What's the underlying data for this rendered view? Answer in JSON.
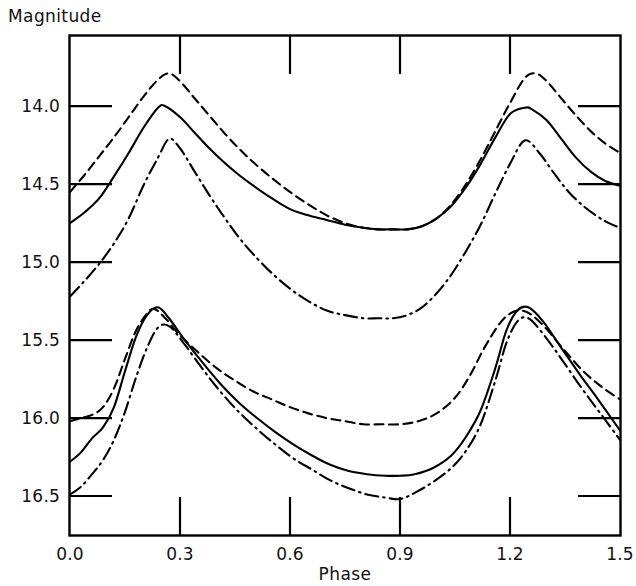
{
  "chart_data": {
    "type": "line",
    "title": "",
    "xlabel": "Phase",
    "ylabel": "Magnitude",
    "xlim": [
      0.0,
      1.5
    ],
    "ylim": [
      16.75,
      13.55
    ],
    "y_inverted": true,
    "grid": false,
    "legend_position": "none",
    "xticks": [
      0.0,
      0.3,
      0.6,
      0.9,
      1.2,
      1.5
    ],
    "xtick_labels": [
      "0.0",
      "0.3",
      "0.6",
      "0.9",
      "1.2",
      "1.5"
    ],
    "yticks": [
      14.0,
      14.5,
      15.0,
      15.5,
      16.0,
      16.5
    ],
    "ytick_labels": [
      "14.0",
      "14.5",
      "15.0",
      "15.5",
      "16.0",
      "16.5"
    ],
    "series": [
      {
        "name": "upper-band-dashed",
        "group": "upper",
        "style": "dashed",
        "x": [
          0.0,
          0.04,
          0.08,
          0.12,
          0.16,
          0.2,
          0.24,
          0.27,
          0.3,
          0.34,
          0.38,
          0.42,
          0.46,
          0.5,
          0.55,
          0.6,
          0.65,
          0.7,
          0.75,
          0.8,
          0.84,
          0.88,
          0.92,
          0.96,
          1.0,
          1.04,
          1.08,
          1.12,
          1.16,
          1.2,
          1.24,
          1.27,
          1.3,
          1.34,
          1.38,
          1.42,
          1.46,
          1.5
        ],
        "y": [
          14.55,
          14.44,
          14.32,
          14.2,
          14.07,
          13.94,
          13.83,
          13.79,
          13.84,
          13.95,
          14.06,
          14.17,
          14.27,
          14.36,
          14.46,
          14.55,
          14.63,
          14.7,
          14.75,
          14.78,
          14.79,
          14.79,
          14.79,
          14.77,
          14.72,
          14.63,
          14.5,
          14.34,
          14.16,
          13.98,
          13.82,
          13.79,
          13.84,
          13.95,
          14.06,
          14.16,
          14.24,
          14.3
        ]
      },
      {
        "name": "upper-band-solid",
        "group": "upper",
        "style": "solid",
        "x": [
          0.0,
          0.04,
          0.08,
          0.12,
          0.16,
          0.2,
          0.24,
          0.26,
          0.3,
          0.34,
          0.38,
          0.42,
          0.46,
          0.5,
          0.55,
          0.6,
          0.65,
          0.7,
          0.75,
          0.8,
          0.84,
          0.88,
          0.92,
          0.96,
          1.0,
          1.04,
          1.08,
          1.12,
          1.16,
          1.2,
          1.24,
          1.26,
          1.3,
          1.34,
          1.38,
          1.42,
          1.46,
          1.5
        ],
        "y": [
          14.75,
          14.68,
          14.59,
          14.45,
          14.3,
          14.14,
          14.01,
          14.0,
          14.07,
          14.17,
          14.27,
          14.36,
          14.44,
          14.51,
          14.59,
          14.66,
          14.7,
          14.73,
          14.76,
          14.78,
          14.79,
          14.79,
          14.79,
          14.77,
          14.72,
          14.64,
          14.52,
          14.37,
          14.2,
          14.05,
          14.01,
          14.02,
          14.09,
          14.21,
          14.33,
          14.42,
          14.48,
          14.51
        ]
      },
      {
        "name": "upper-band-dashdot",
        "group": "upper",
        "style": "dashdot",
        "x": [
          0.0,
          0.04,
          0.08,
          0.12,
          0.16,
          0.2,
          0.24,
          0.27,
          0.3,
          0.34,
          0.38,
          0.42,
          0.46,
          0.5,
          0.55,
          0.6,
          0.65,
          0.7,
          0.75,
          0.8,
          0.84,
          0.88,
          0.92,
          0.96,
          1.0,
          1.04,
          1.08,
          1.12,
          1.16,
          1.2,
          1.24,
          1.28,
          1.32,
          1.36,
          1.4,
          1.44,
          1.47,
          1.5
        ],
        "y": [
          15.22,
          15.12,
          15.01,
          14.88,
          14.72,
          14.51,
          14.33,
          14.21,
          14.27,
          14.42,
          14.57,
          14.71,
          14.84,
          14.95,
          15.07,
          15.17,
          15.25,
          15.31,
          15.34,
          15.36,
          15.36,
          15.36,
          15.34,
          15.29,
          15.2,
          15.08,
          14.93,
          14.76,
          14.56,
          14.37,
          14.22,
          14.3,
          14.43,
          14.55,
          14.64,
          14.71,
          14.75,
          14.78
        ]
      },
      {
        "name": "lower-band-dashed",
        "group": "lower",
        "style": "dashed",
        "x": [
          0.0,
          0.03,
          0.06,
          0.09,
          0.12,
          0.15,
          0.18,
          0.21,
          0.23,
          0.26,
          0.3,
          0.35,
          0.4,
          0.45,
          0.5,
          0.55,
          0.6,
          0.65,
          0.7,
          0.75,
          0.8,
          0.85,
          0.9,
          0.95,
          1.0,
          1.05,
          1.09,
          1.13,
          1.17,
          1.2,
          1.23,
          1.26,
          1.3,
          1.35,
          1.4,
          1.45,
          1.5
        ],
        "y": [
          16.02,
          16.0,
          15.98,
          15.93,
          15.81,
          15.62,
          15.44,
          15.33,
          15.3,
          15.36,
          15.47,
          15.58,
          15.68,
          15.76,
          15.83,
          15.88,
          15.93,
          15.97,
          16.0,
          16.02,
          16.04,
          16.04,
          16.04,
          16.02,
          15.97,
          15.87,
          15.73,
          15.55,
          15.4,
          15.33,
          15.31,
          15.34,
          15.43,
          15.57,
          15.7,
          15.8,
          15.88
        ]
      },
      {
        "name": "lower-band-solid",
        "group": "lower",
        "style": "solid",
        "x": [
          0.0,
          0.03,
          0.06,
          0.09,
          0.12,
          0.15,
          0.18,
          0.21,
          0.24,
          0.27,
          0.31,
          0.36,
          0.41,
          0.46,
          0.51,
          0.56,
          0.61,
          0.66,
          0.71,
          0.76,
          0.81,
          0.86,
          0.9,
          0.94,
          0.99,
          1.04,
          1.08,
          1.12,
          1.16,
          1.19,
          1.22,
          1.25,
          1.29,
          1.34,
          1.39,
          1.44,
          1.5
        ],
        "y": [
          16.28,
          16.22,
          16.13,
          16.06,
          15.93,
          15.7,
          15.48,
          15.34,
          15.29,
          15.36,
          15.49,
          15.64,
          15.78,
          15.9,
          16.0,
          16.09,
          16.17,
          16.24,
          16.3,
          16.34,
          16.36,
          16.37,
          16.37,
          16.36,
          16.32,
          16.24,
          16.12,
          15.95,
          15.68,
          15.44,
          15.31,
          15.29,
          15.38,
          15.55,
          15.72,
          15.88,
          16.08
        ]
      },
      {
        "name": "lower-band-dashdot",
        "group": "lower",
        "style": "dashdot",
        "x": [
          0.0,
          0.03,
          0.06,
          0.09,
          0.12,
          0.15,
          0.18,
          0.21,
          0.24,
          0.27,
          0.31,
          0.36,
          0.41,
          0.46,
          0.51,
          0.56,
          0.61,
          0.66,
          0.71,
          0.76,
          0.81,
          0.86,
          0.9,
          0.94,
          0.99,
          1.04,
          1.08,
          1.12,
          1.16,
          1.19,
          1.22,
          1.25,
          1.29,
          1.34,
          1.39,
          1.44,
          1.5
        ],
        "y": [
          16.49,
          16.44,
          16.36,
          16.27,
          16.14,
          15.96,
          15.74,
          15.55,
          15.42,
          15.41,
          15.52,
          15.68,
          15.83,
          15.96,
          16.07,
          16.17,
          16.26,
          16.33,
          16.4,
          16.45,
          16.49,
          16.51,
          16.52,
          16.48,
          16.41,
          16.32,
          16.21,
          16.04,
          15.76,
          15.52,
          15.38,
          15.36,
          15.46,
          15.62,
          15.79,
          15.95,
          16.14
        ]
      }
    ]
  },
  "axes": {
    "ylabel_text": "Magnitude",
    "xlabel_text": "Phase"
  }
}
